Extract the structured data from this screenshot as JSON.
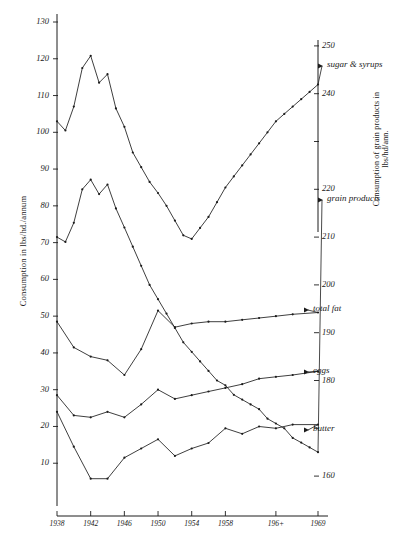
{
  "chart_data": {
    "type": "line",
    "title": "",
    "xlabel": "",
    "ylabel": "Consumption in lbs/hd./annum",
    "ylabel_right": "Consumption of grain products in lbs/hd/ann.",
    "grid": false,
    "legend_position": "right-inline-labels",
    "x": [
      1938,
      1939,
      1940,
      1941,
      1942,
      1943,
      1944,
      1945,
      1946,
      1947,
      1948,
      1949,
      1950,
      1951,
      1952,
      1953,
      1954,
      1955,
      1956,
      1957,
      1958,
      1959,
      1960,
      1961,
      1962,
      1963,
      1964,
      1965,
      1966,
      1967,
      1968,
      1969
    ],
    "xticks": [
      1938,
      1942,
      1946,
      1950,
      1954,
      1958,
      1964,
      1969
    ],
    "xticklabels": [
      "1938",
      "1942",
      "1946",
      "1950",
      "1954",
      "1958",
      "196+",
      "1969"
    ],
    "ylim": [
      0,
      130
    ],
    "yticks": [
      10,
      20,
      30,
      40,
      50,
      60,
      70,
      80,
      90,
      100,
      110,
      120,
      130
    ],
    "ylim_right": [
      155,
      255
    ],
    "yticks_right": [
      160,
      170,
      180,
      190,
      200,
      210,
      220,
      230,
      240,
      250
    ],
    "yticklabels_right": [
      "160",
      "170",
      "180",
      "190",
      "200",
      "210",
      "220",
      "230",
      "240",
      "250"
    ],
    "series": [
      {
        "name": "sugar & syrups",
        "axis": "left",
        "label": "sugar & syrups",
        "x": [
          1938,
          1939,
          1940,
          1941,
          1942,
          1943,
          1944,
          1945,
          1946,
          1947,
          1948,
          1949,
          1950,
          1951,
          1952,
          1953,
          1954,
          1955,
          1956,
          1957,
          1958,
          1959,
          1960,
          1961,
          1962,
          1963,
          1964,
          1965,
          1966,
          1967,
          1968,
          1969
        ],
        "values": [
          103,
          100.5,
          107,
          117.5,
          120.8,
          113.5,
          115.8,
          106.5,
          101.5,
          94.5,
          90.5,
          86.5,
          83.5,
          80,
          76,
          72,
          71,
          74,
          77,
          81,
          85,
          88,
          91,
          94,
          97,
          100,
          103,
          105,
          107,
          109,
          111,
          113
        ]
      },
      {
        "name": "grain products",
        "axis": "right",
        "label": "grain products",
        "x": [
          1938,
          1939,
          1940,
          1941,
          1942,
          1943,
          1944,
          1945,
          1946,
          1947,
          1948,
          1949,
          1950,
          1951,
          1952,
          1953,
          1954,
          1955,
          1956,
          1957,
          1958,
          1959,
          1960,
          1961,
          1962,
          1963,
          1964,
          1965,
          1966,
          1967,
          1968,
          1969
        ],
        "values": [
          210,
          209,
          213,
          220,
          222,
          219,
          221,
          216,
          212,
          208,
          204,
          200,
          197,
          194,
          191,
          188,
          186,
          184,
          182,
          180,
          179,
          177,
          176,
          175,
          174,
          172,
          171,
          170,
          168,
          167,
          166,
          165
        ]
      },
      {
        "name": "total fat",
        "axis": "left",
        "label": "total fat",
        "x": [
          1938,
          1940,
          1942,
          1944,
          1946,
          1948,
          1950,
          1952,
          1954,
          1956,
          1958,
          1960,
          1962,
          1964,
          1966,
          1969
        ],
        "values": [
          48.5,
          41.5,
          39,
          38,
          34,
          41,
          51.5,
          47,
          48,
          48.5,
          48.5,
          49,
          49.5,
          50,
          50.5,
          51
        ]
      },
      {
        "name": "eggs",
        "axis": "left",
        "label": "eggs",
        "x": [
          1938,
          1940,
          1942,
          1944,
          1946,
          1948,
          1950,
          1952,
          1954,
          1956,
          1958,
          1960,
          1962,
          1964,
          1966,
          1969
        ],
        "values": [
          28.5,
          23,
          22.5,
          24,
          22.5,
          26,
          30,
          27.5,
          28.5,
          29.5,
          30.5,
          31.5,
          33,
          33.5,
          34,
          35
        ]
      },
      {
        "name": "butter",
        "axis": "left",
        "label": "butter",
        "x": [
          1938,
          1940,
          1942,
          1944,
          1946,
          1948,
          1950,
          1952,
          1954,
          1956,
          1958,
          1960,
          1962,
          1964,
          1966,
          1969
        ],
        "values": [
          24,
          14.5,
          5.8,
          5.8,
          11.5,
          14,
          16.5,
          12,
          14,
          15.5,
          19.5,
          18,
          20,
          19.5,
          20.5,
          20.5
        ]
      }
    ]
  },
  "axes": {
    "left_title": "Consumption in lbs/hd./annum",
    "right_title": "Consumption of grain products in lbs/hd/ann."
  },
  "labels": {
    "sugar": "sugar & syrups",
    "grain": "grain products",
    "totalfat": "total fat",
    "eggs": "eggs",
    "butter": "butter"
  }
}
